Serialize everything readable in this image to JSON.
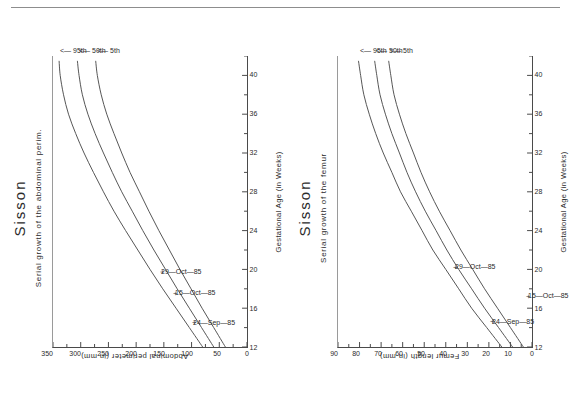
{
  "page": {
    "background": "#ffffff",
    "rule_color": "#8d8d8d",
    "ink_color": "#2b2b2b",
    "curve_color": "#555555",
    "orientation_note": "charts-rotated-90-ccw"
  },
  "charts": [
    {
      "id": "abdominal-perimeter",
      "title": "Sisson",
      "subtitle": "Serial growth of the abdominal perim.",
      "xlabel": "Gestational Age (in Weeks)",
      "ylabel": "Abdominal perimeter (in mm)",
      "xticks": [
        "12",
        "16",
        "20",
        "24",
        "28",
        "32",
        "36",
        "40"
      ],
      "yticks": [
        "0",
        "50",
        "100",
        "150",
        "200",
        "250",
        "300",
        "350"
      ],
      "percentiles": [
        "95th",
        "50th",
        "5th"
      ],
      "arrow_glyph": "<—",
      "annotations": [
        "29—Oct—85",
        "15—Oct—85",
        "24—Sep—85"
      ],
      "marker_glyph": "+"
    },
    {
      "id": "femur-length",
      "title": "Sisson",
      "subtitle": "Serial growth of the femur",
      "xlabel": "Gestational Age (in Weeks)",
      "ylabel": "Femur length (in mm)",
      "xticks": [
        "12",
        "16",
        "20",
        "24",
        "28",
        "32",
        "36",
        "40"
      ],
      "yticks": [
        "0",
        "10",
        "20",
        "30",
        "40",
        "50",
        "60",
        "70",
        "80",
        "90"
      ],
      "percentiles": [
        "95th",
        "50th",
        "5th"
      ],
      "arrow_glyph": "<—",
      "annotations": [
        "29—Oct—85",
        "24—Sep—85",
        "15—Oct—85"
      ],
      "marker_glyph": "+"
    }
  ],
  "chart_data": [
    {
      "type": "line",
      "id": "abdominal-perimeter",
      "title": "Sisson",
      "subtitle": "Serial growth of the abdominal perim.",
      "xlabel": "Gestational Age (in Weeks)",
      "ylabel": "Abdominal perimeter (in mm)",
      "xlim": [
        12,
        42
      ],
      "ylim": [
        0,
        350
      ],
      "xticks": [
        12,
        16,
        20,
        24,
        28,
        32,
        36,
        40
      ],
      "yticks": [
        0,
        50,
        100,
        150,
        200,
        250,
        300,
        350
      ],
      "minor_ticks": true,
      "grid": false,
      "legend_position": "right-of-plot",
      "x": [
        12,
        14,
        16,
        18,
        20,
        22,
        24,
        26,
        28,
        30,
        32,
        34,
        36,
        38,
        40,
        41.5
      ],
      "series": [
        {
          "name": "95th",
          "values": [
            80,
            104,
            128,
            152,
            175,
            197,
            219,
            240,
            259,
            277,
            294,
            309,
            322,
            331,
            337,
            339
          ]
        },
        {
          "name": "50th",
          "values": [
            60,
            82,
            104,
            126,
            147,
            168,
            188,
            207,
            226,
            243,
            259,
            274,
            287,
            297,
            303,
            306
          ]
        },
        {
          "name": "5th",
          "values": [
            39,
            60,
            81,
            101,
            121,
            140,
            159,
            177,
            194,
            211,
            226,
            240,
            253,
            263,
            270,
            273
          ]
        }
      ],
      "point_annotations": [
        {
          "label": "24—Sep—85",
          "x": 14.5,
          "y": 98
        },
        {
          "label": "15—Oct—85",
          "x": 17.5,
          "y": 131
        },
        {
          "label": "29—Oct—85",
          "x": 19.7,
          "y": 155
        }
      ]
    },
    {
      "type": "line",
      "id": "femur-length",
      "title": "Sisson",
      "subtitle": "Serial growth of the femur",
      "xlabel": "Gestational Age (in Weeks)",
      "ylabel": "Femur length (in mm)",
      "xlim": [
        12,
        42
      ],
      "ylim": [
        0,
        90
      ],
      "xticks": [
        12,
        16,
        20,
        24,
        28,
        32,
        36,
        40
      ],
      "yticks": [
        0,
        10,
        20,
        30,
        40,
        50,
        60,
        70,
        80,
        90
      ],
      "minor_ticks": true,
      "grid": false,
      "legend_position": "right-of-plot",
      "x": [
        12,
        14,
        16,
        18,
        20,
        22,
        24,
        26,
        28,
        30,
        32,
        34,
        36,
        38,
        40,
        41.5
      ],
      "series": [
        {
          "name": "95th",
          "values": [
            14,
            21,
            28,
            34,
            40,
            46,
            51,
            56,
            61,
            65,
            69,
            72.5,
            75.5,
            78,
            79.5,
            80.5
          ]
        },
        {
          "name": "50th",
          "values": [
            9,
            15.5,
            22,
            28,
            34,
            39.5,
            44.5,
            49.5,
            54,
            58,
            61.5,
            65,
            68,
            70.5,
            72,
            73
          ]
        },
        {
          "name": "5th",
          "values": [
            4,
            10,
            16,
            22,
            27.5,
            33,
            38,
            43,
            47.5,
            51.5,
            55,
            58.5,
            61.5,
            64,
            65.5,
            66.5
          ]
        }
      ],
      "point_annotations": [
        {
          "label": "24—Sep—85",
          "x": 14.6,
          "y": 19
        },
        {
          "label": "29—Oct—85",
          "x": 20.2,
          "y": 36
        },
        {
          "label": "15—Oct—85",
          "x": 17.2,
          "y": 2.5
        }
      ]
    }
  ]
}
